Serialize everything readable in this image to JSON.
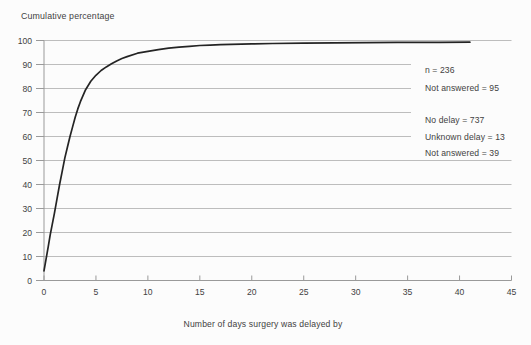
{
  "figure": {
    "title": "Cumulative percentage",
    "x_axis_title": "Number of days surgery was delayed by"
  },
  "colors": {
    "background": "#fcfcfc",
    "text": "#424242",
    "grid": "#bdbdbd",
    "axis": "#9a9a9a",
    "curve": "#242424"
  },
  "chart_data": {
    "type": "line",
    "title": "Cumulative percentage",
    "xlabel": "Number of days surgery was delayed by",
    "ylabel": "Cumulative percentage",
    "xlim": [
      0,
      45
    ],
    "ylim": [
      0,
      100
    ],
    "x_ticks": [
      0,
      5,
      10,
      15,
      20,
      25,
      30,
      35,
      40,
      45
    ],
    "y_ticks": [
      0,
      10,
      20,
      30,
      40,
      50,
      60,
      70,
      80,
      90,
      100
    ],
    "grid": true,
    "legend_position": "none",
    "annotations": [
      "n = 236",
      "Not answered = 95",
      "No delay = 737",
      "Unknown delay = 13",
      "Not answered = 39"
    ],
    "series": [
      {
        "name": "Cumulative percentage of cases by number of days surgery was delayed",
        "points": [
          [
            0,
            4
          ],
          [
            0.2,
            9
          ],
          [
            0.4,
            14
          ],
          [
            0.6,
            19
          ],
          [
            0.8,
            23.5
          ],
          [
            1,
            28
          ],
          [
            1.25,
            34
          ],
          [
            1.5,
            40
          ],
          [
            1.75,
            45.5
          ],
          [
            2,
            51
          ],
          [
            2.25,
            55.5
          ],
          [
            2.5,
            60
          ],
          [
            2.75,
            64
          ],
          [
            3,
            68
          ],
          [
            3.25,
            71.5
          ],
          [
            3.5,
            74.5
          ],
          [
            3.75,
            77
          ],
          [
            4,
            79.5
          ],
          [
            4.5,
            83
          ],
          [
            5,
            85.5
          ],
          [
            5.5,
            87.5
          ],
          [
            6,
            89
          ],
          [
            6.5,
            90.3
          ],
          [
            7,
            91.5
          ],
          [
            7.5,
            92.5
          ],
          [
            8,
            93.3
          ],
          [
            9,
            94.7
          ],
          [
            10,
            95.5
          ],
          [
            11,
            96.2
          ],
          [
            12,
            96.8
          ],
          [
            13,
            97.2
          ],
          [
            14,
            97.6
          ],
          [
            15,
            97.9
          ],
          [
            16,
            98.1
          ],
          [
            17,
            98.25
          ],
          [
            18,
            98.4
          ],
          [
            20,
            98.6
          ],
          [
            22,
            98.75
          ],
          [
            25,
            98.9
          ],
          [
            28,
            99.0
          ],
          [
            31,
            99.1
          ],
          [
            34,
            99.2
          ],
          [
            38,
            99.25
          ],
          [
            41,
            99.3
          ]
        ]
      }
    ]
  }
}
